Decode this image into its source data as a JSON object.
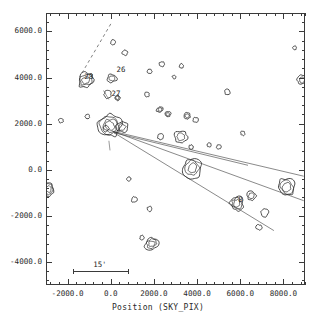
{
  "figure": {
    "top_cropped_title": "",
    "xaxis_title": "Position (SKY_PIX)",
    "scalebar_label": "15'"
  },
  "axes": {
    "x_ticklabels": [
      "-2000.0",
      "0.0",
      "2000.0",
      "4000.0",
      "6000.0",
      "8000.0"
    ],
    "y_ticklabels": [
      "-4000.0",
      "-2000.0",
      "0.0",
      "2000.0",
      "4000.0",
      "6000.0"
    ]
  },
  "source_labels": [
    {
      "id": "28",
      "x": 0.148,
      "y": 0.222
    },
    {
      "id": "26",
      "x": 0.272,
      "y": 0.196
    },
    {
      "id": "27",
      "x": 0.253,
      "y": 0.282
    },
    {
      "id": "8",
      "x": 0.742,
      "y": 0.672
    }
  ],
  "chart_data": {
    "type": "scatter",
    "title": "",
    "xlabel": "Position (SKY_PIX)",
    "ylabel": "",
    "xlim": [
      -3000,
      9000
    ],
    "ylim": [
      6800,
      -5000
    ],
    "grid": false,
    "legend": null,
    "x_ticks": [
      -2000,
      0,
      2000,
      4000,
      6000,
      8000
    ],
    "y_ticks": [
      -4000,
      -2000,
      0,
      2000,
      4000,
      6000
    ],
    "x_tick_labels": [
      "-2000.0",
      "0.0",
      "2000.0",
      "4000.0",
      "6000.0",
      "8000.0"
    ],
    "y_tick_labels": [
      "-4000.0",
      "-2000.0",
      "0.0",
      "2000.0",
      "4000.0",
      "6000.0"
    ],
    "annotations": [
      "28",
      "26",
      "27",
      "8",
      "15'"
    ],
    "note": "Contour map of extended sources; each source drawn as nested contour rings. Coordinates below are normalized fractions of the plot frame (0-1), rings in px radius.",
    "sources": [
      {
        "cx": 0.155,
        "cy": 0.246,
        "rx": 8.5,
        "ry": 7.0,
        "rings": 3,
        "rot": -25
      },
      {
        "cx": 0.255,
        "cy": 0.24,
        "rx": 4.6,
        "ry": 4.0,
        "rings": 2,
        "rot": 0
      },
      {
        "cx": 0.238,
        "cy": 0.3,
        "rx": 3.8,
        "ry": 3.6,
        "rings": 1,
        "rot": 0
      },
      {
        "cx": 0.276,
        "cy": 0.312,
        "rx": 2.6,
        "ry": 2.6,
        "rings": 2,
        "rot": 0
      },
      {
        "cx": 0.246,
        "cy": 0.414,
        "rx": 12.0,
        "ry": 10.5,
        "rings": 4,
        "rot": 15
      },
      {
        "cx": 0.293,
        "cy": 0.42,
        "rx": 6.0,
        "ry": 5.0,
        "rings": 2,
        "rot": -10
      },
      {
        "cx": 0.232,
        "cy": 0.425,
        "rx": 3.0,
        "ry": 3.0,
        "rings": 1,
        "rot": 0
      },
      {
        "cx": 0.01,
        "cy": 0.648,
        "rx": 5.0,
        "ry": 7.0,
        "rings": 3,
        "rot": 0
      },
      {
        "cx": 0.565,
        "cy": 0.57,
        "rx": 9.0,
        "ry": 10.0,
        "rings": 3,
        "rot": 0
      },
      {
        "cx": 0.737,
        "cy": 0.7,
        "rx": 6.5,
        "ry": 7.5,
        "rings": 3,
        "rot": 0
      },
      {
        "cx": 0.793,
        "cy": 0.672,
        "rx": 4.6,
        "ry": 4.4,
        "rings": 2,
        "rot": 0
      },
      {
        "cx": 0.93,
        "cy": 0.64,
        "rx": 8.5,
        "ry": 9.0,
        "rings": 3,
        "rot": 0
      },
      {
        "cx": 0.988,
        "cy": 0.246,
        "rx": 4.6,
        "ry": 4.4,
        "rings": 2,
        "rot": 0
      },
      {
        "cx": 0.845,
        "cy": 0.735,
        "rx": 3.6,
        "ry": 4.4,
        "rings": 1,
        "rot": 20
      },
      {
        "cx": 0.822,
        "cy": 0.788,
        "rx": 2.8,
        "ry": 2.6,
        "rings": 1,
        "rot": 0
      },
      {
        "cx": 0.408,
        "cy": 0.848,
        "rx": 7.0,
        "ry": 5.6,
        "rings": 3,
        "rot": -20
      },
      {
        "cx": 0.371,
        "cy": 0.826,
        "rx": 2.2,
        "ry": 2.2,
        "rings": 1,
        "rot": 0
      },
      {
        "cx": 0.4,
        "cy": 0.72,
        "rx": 2.6,
        "ry": 2.6,
        "rings": 1,
        "rot": 0
      },
      {
        "cx": 0.34,
        "cy": 0.686,
        "rx": 2.8,
        "ry": 2.8,
        "rings": 1,
        "rot": 0
      },
      {
        "cx": 0.32,
        "cy": 0.61,
        "rx": 2.0,
        "ry": 2.0,
        "rings": 1,
        "rot": 0
      },
      {
        "cx": 0.44,
        "cy": 0.355,
        "rx": 3.4,
        "ry": 2.6,
        "rings": 2,
        "rot": -25
      },
      {
        "cx": 0.47,
        "cy": 0.372,
        "rx": 3.0,
        "ry": 2.6,
        "rings": 2,
        "rot": 0
      },
      {
        "cx": 0.545,
        "cy": 0.378,
        "rx": 3.4,
        "ry": 3.2,
        "rings": 2,
        "rot": 0
      },
      {
        "cx": 0.578,
        "cy": 0.393,
        "rx": 3.0,
        "ry": 2.4,
        "rings": 1,
        "rot": -15
      },
      {
        "cx": 0.443,
        "cy": 0.455,
        "rx": 3.2,
        "ry": 2.8,
        "rings": 1,
        "rot": 0
      },
      {
        "cx": 0.52,
        "cy": 0.455,
        "rx": 6.5,
        "ry": 5.5,
        "rings": 2,
        "rot": 0
      },
      {
        "cx": 0.39,
        "cy": 0.3,
        "rx": 2.4,
        "ry": 2.4,
        "rings": 1,
        "rot": 0
      },
      {
        "cx": 0.447,
        "cy": 0.188,
        "rx": 2.6,
        "ry": 2.6,
        "rings": 1,
        "rot": 0
      },
      {
        "cx": 0.523,
        "cy": 0.195,
        "rx": 2.2,
        "ry": 2.2,
        "rings": 1,
        "rot": 0
      },
      {
        "cx": 0.7,
        "cy": 0.29,
        "rx": 2.8,
        "ry": 2.8,
        "rings": 1,
        "rot": 0
      },
      {
        "cx": 0.76,
        "cy": 0.442,
        "rx": 2.2,
        "ry": 2.2,
        "rings": 1,
        "rot": 0
      },
      {
        "cx": 0.258,
        "cy": 0.108,
        "rx": 2.4,
        "ry": 2.4,
        "rings": 1,
        "rot": 0
      },
      {
        "cx": 0.305,
        "cy": 0.146,
        "rx": 2.6,
        "ry": 2.6,
        "rings": 1,
        "rot": 0
      },
      {
        "cx": 0.058,
        "cy": 0.395,
        "rx": 2.2,
        "ry": 2.2,
        "rings": 1,
        "rot": 0
      },
      {
        "cx": 0.16,
        "cy": 0.38,
        "rx": 2.2,
        "ry": 2.2,
        "rings": 1,
        "rot": 0
      },
      {
        "cx": 0.4,
        "cy": 0.215,
        "rx": 2.2,
        "ry": 2.2,
        "rings": 1,
        "rot": 0
      },
      {
        "cx": 0.495,
        "cy": 0.235,
        "rx": 1.8,
        "ry": 1.8,
        "rings": 1,
        "rot": 0
      },
      {
        "cx": 0.96,
        "cy": 0.128,
        "rx": 2.0,
        "ry": 2.0,
        "rings": 1,
        "rot": 0
      },
      {
        "cx": 0.63,
        "cy": 0.485,
        "rx": 2.0,
        "ry": 2.0,
        "rings": 1,
        "rot": 0
      },
      {
        "cx": 0.667,
        "cy": 0.492,
        "rx": 2.2,
        "ry": 2.2,
        "rings": 1,
        "rot": 0
      },
      {
        "cx": 0.56,
        "cy": 0.493,
        "rx": 2.2,
        "ry": 2.2,
        "rings": 1,
        "rot": 0
      }
    ],
    "rays": [
      {
        "x1": 0.258,
        "y1": 0.435,
        "x2": 0.995,
        "y2": 0.69
      },
      {
        "x1": 0.258,
        "y1": 0.435,
        "x2": 0.995,
        "y2": 0.6
      },
      {
        "x1": 0.262,
        "y1": 0.44,
        "x2": 0.88,
        "y2": 0.8
      },
      {
        "x1": 0.262,
        "y1": 0.44,
        "x2": 0.78,
        "y2": 0.56
      }
    ],
    "dashed_lines": [
      {
        "x1": 0.25,
        "y1": 0.04,
        "x2": 0.13,
        "y2": 0.235
      }
    ]
  }
}
